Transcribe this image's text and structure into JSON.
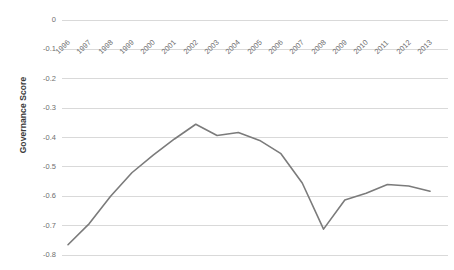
{
  "chart_data": {
    "type": "line",
    "title": "",
    "xlabel": "",
    "ylabel": "Governance Score",
    "x": [
      1996,
      1997,
      1998,
      1999,
      2000,
      2001,
      2002,
      2003,
      2004,
      2005,
      2006,
      2007,
      2008,
      2009,
      2010,
      2011,
      2012,
      2013
    ],
    "categories": [
      "1996",
      "1997",
      "1998",
      "1999",
      "2000",
      "2001",
      "2002",
      "2003",
      "2004",
      "2005",
      "2006",
      "2007",
      "2008",
      "2009",
      "2010",
      "2011",
      "2012",
      "2013"
    ],
    "values": [
      -0.765,
      -0.693,
      -0.6,
      -0.52,
      -0.46,
      -0.405,
      -0.355,
      -0.393,
      -0.383,
      -0.41,
      -0.455,
      -0.555,
      -0.712,
      -0.613,
      -0.59,
      -0.56,
      -0.565,
      -0.583
    ],
    "series": [
      {
        "name": "Governance Score",
        "values": [
          -0.765,
          -0.693,
          -0.6,
          -0.52,
          -0.46,
          -0.405,
          -0.355,
          -0.393,
          -0.383,
          -0.41,
          -0.455,
          -0.555,
          -0.712,
          -0.613,
          -0.59,
          -0.56,
          -0.565,
          -0.583
        ],
        "color": "#7b7b7b"
      }
    ],
    "ylim": [
      -0.8,
      0.0
    ],
    "yticks": [
      0,
      -0.1,
      -0.2,
      -0.3,
      -0.4,
      -0.5,
      -0.6,
      -0.7,
      -0.8
    ],
    "ytick_labels": [
      "0",
      "-0.1",
      "-0.2",
      "-0.3",
      "-0.4",
      "-0.5",
      "-0.6",
      "-0.7",
      "-0.8"
    ],
    "grid": true,
    "grid_color": "#d9d9d9",
    "legend": false,
    "legend_position": "none",
    "xtick_rotation": -45,
    "background": "#ffffff"
  }
}
